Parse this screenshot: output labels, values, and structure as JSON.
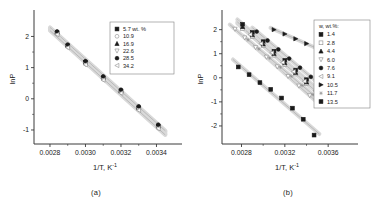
{
  "figure": {
    "panel_a_caption": "(a)",
    "panel_b_caption": "(b)"
  },
  "chart_data": [
    {
      "id": "panel_a",
      "type": "scatter",
      "title": "",
      "caption": "(a)",
      "xlabel": "1/T, K",
      "xlabel_sup": "-1",
      "ylabel": "lnP",
      "xlim": [
        0.00271,
        0.00351
      ],
      "ylim": [
        -1.45,
        2.72
      ],
      "xticks": [
        0.0028,
        0.003,
        0.0032,
        0.0034
      ],
      "xticklabels": [
        "0.0028",
        "0.0030",
        "0.0032",
        "0.0034"
      ],
      "yticks": [
        -1,
        0,
        1,
        2
      ],
      "yticklabels": [
        "-1",
        "0",
        "1",
        "2"
      ],
      "grid": false,
      "legend_position": "upper-right",
      "legend_title": "",
      "series": [
        {
          "name": "5.7 wt. %",
          "marker": "square-filled",
          "color": "#1a1a1a",
          "x": [
            0.00284,
            0.0029,
            0.003,
            0.0031,
            0.0032,
            0.0033,
            0.00341
          ],
          "y": [
            2.12,
            1.7,
            1.17,
            0.67,
            0.25,
            -0.29,
            -0.88
          ]
        },
        {
          "name": "10.9",
          "marker": "circle-open",
          "color": "#8c8c8c",
          "x": [
            0.00284,
            0.0029,
            0.003,
            0.0031,
            0.0032,
            0.0033,
            0.00341
          ],
          "y": [
            2.1,
            1.68,
            1.13,
            0.64,
            0.22,
            -0.33,
            -0.92
          ]
        },
        {
          "name": "16.9",
          "marker": "triangle-up-filled",
          "color": "#1a1a1a",
          "x": [
            0.00284,
            0.0029,
            0.003,
            0.0031,
            0.0032,
            0.0033,
            0.00341
          ],
          "y": [
            2.14,
            1.72,
            1.19,
            0.7,
            0.27,
            -0.26,
            -0.85
          ]
        },
        {
          "name": "22.6",
          "marker": "triangle-down-open",
          "color": "#8c8c8c",
          "x": [
            0.00284,
            0.0029,
            0.003,
            0.0031,
            0.0032,
            0.0033,
            0.00341
          ],
          "y": [
            2.08,
            1.66,
            1.11,
            0.62,
            0.2,
            -0.35,
            -0.94
          ]
        },
        {
          "name": "28.5",
          "marker": "circle-filled",
          "color": "#1a1a1a",
          "x": [
            0.00284,
            0.0029,
            0.003,
            0.0031,
            0.0032,
            0.0033,
            0.00341
          ],
          "y": [
            2.16,
            1.74,
            1.21,
            0.72,
            0.29,
            -0.24,
            -0.83
          ]
        },
        {
          "name": "34.2",
          "marker": "triangle-left-open",
          "color": "#8c8c8c",
          "x": [
            0.00284,
            0.0029,
            0.003,
            0.0031,
            0.0032,
            0.0033,
            0.00341
          ],
          "y": [
            2.06,
            1.64,
            1.09,
            0.6,
            0.18,
            -0.37,
            -0.96
          ]
        }
      ],
      "legend_entries": [
        {
          "label": "5.7 wt. %",
          "marker": "square-filled"
        },
        {
          "label": "10.9",
          "marker": "circle-open"
        },
        {
          "label": "16.9",
          "marker": "triangle-up-filled"
        },
        {
          "label": "22.6",
          "marker": "triangle-down-open"
        },
        {
          "label": "28.5",
          "marker": "circle-filled"
        },
        {
          "label": "34.2",
          "marker": "triangle-left-open"
        }
      ]
    },
    {
      "id": "panel_b",
      "type": "scatter",
      "title": "",
      "caption": "(b)",
      "xlabel": "1/T, K",
      "xlabel_sup": "-1",
      "ylabel": "lnP",
      "xlim": [
        0.00262,
        0.00382
      ],
      "ylim": [
        -2.75,
        2.65
      ],
      "xticks": [
        0.0028,
        0.0032,
        0.0036
      ],
      "xticklabels": [
        "0.0028",
        "0.0032",
        "0.0036"
      ],
      "yticks": [
        -2,
        -1,
        0,
        1,
        2
      ],
      "yticklabels": [
        "-2",
        "-1",
        "0",
        "1",
        "2"
      ],
      "grid": false,
      "legend_position": "upper-right",
      "legend_title": "w, wt.%:",
      "series": [
        {
          "name": "1.4",
          "marker": "square-filled",
          "color": "#1a1a1a",
          "x": [
            0.00281,
            0.0029,
            0.003,
            0.0031,
            0.0032,
            0.0033,
            0.0034,
            0.0035
          ],
          "y": [
            2.22,
            1.88,
            1.5,
            1.1,
            0.72,
            0.32,
            -0.08,
            -0.48
          ]
        },
        {
          "name": "2.8",
          "marker": "square-open",
          "color": "#8c8c8c",
          "x": [
            0.00281,
            0.0029,
            0.003,
            0.0031,
            0.0032,
            0.0033,
            0.0034,
            0.0035
          ],
          "y": [
            2.05,
            1.72,
            1.34,
            0.94,
            0.55,
            0.16,
            -0.24,
            -0.63
          ]
        },
        {
          "name": "4.4",
          "marker": "triangle-up-filled",
          "color": "#1a1a1a",
          "x": [
            0.00281,
            0.0029,
            0.003,
            0.0031,
            0.0032,
            0.0033,
            0.0034,
            0.0035
          ],
          "y": [
            2.12,
            1.78,
            1.4,
            1.0,
            0.62,
            0.22,
            -0.18,
            -0.56
          ]
        },
        {
          "name": "6.0",
          "marker": "triangle-down-open",
          "color": "#8c8c8c",
          "x": [
            0.00274,
            0.00283,
            0.00293,
            0.00303,
            0.00313,
            0.00323,
            0.00333,
            0.00343
          ],
          "y": [
            2.02,
            1.66,
            1.26,
            0.86,
            0.46,
            0.06,
            -0.34,
            -0.74
          ]
        },
        {
          "name": "7.6",
          "marker": "circle-filled",
          "color": "#1a1a1a",
          "x": [
            0.00294,
            0.00304,
            0.00314,
            0.00324,
            0.00334,
            0.00344,
            0.00352
          ],
          "y": [
            1.92,
            1.55,
            1.18,
            0.8,
            0.42,
            0.04,
            -0.28
          ]
        },
        {
          "name": "9.1",
          "marker": "triangle-left-open",
          "color": "#8c8c8c",
          "x": [
            0.00288,
            0.00298,
            0.00308,
            0.00318,
            0.00328,
            0.00338,
            0.00348
          ],
          "y": [
            1.8,
            1.42,
            1.04,
            0.64,
            0.26,
            -0.14,
            -0.54
          ]
        },
        {
          "name": "10.5",
          "marker": "triangle-right-filled",
          "color": "#1a1a1a",
          "x": [
            0.0031,
            0.0032,
            0.0033,
            0.0034,
            0.0035,
            0.00356
          ],
          "y": [
            2.0,
            1.82,
            1.62,
            1.42,
            1.22,
            1.08
          ]
        },
        {
          "name": "11.7",
          "marker": "star-open",
          "color": "#8c8c8c",
          "x": [
            0.00286,
            0.00296,
            0.00306,
            0.00316,
            0.00326,
            0.00336,
            0.00346
          ],
          "y": [
            1.58,
            1.2,
            0.82,
            0.44,
            0.06,
            -0.32,
            -0.7
          ]
        },
        {
          "name": "13.5",
          "marker": "square-filled",
          "color": "#1a1a1a",
          "x": [
            0.00277,
            0.00287,
            0.00297,
            0.00307,
            0.00317,
            0.00327,
            0.00337,
            0.00347
          ],
          "y": [
            0.45,
            0.13,
            -0.2,
            -0.48,
            -0.84,
            -1.26,
            -1.72,
            -2.38
          ]
        }
      ],
      "legend_entries": [
        {
          "label": "1.4",
          "marker": "square-filled"
        },
        {
          "label": "2.8",
          "marker": "square-open"
        },
        {
          "label": "4.4",
          "marker": "triangle-up-filled"
        },
        {
          "label": "6.0",
          "marker": "triangle-down-open"
        },
        {
          "label": "7.6",
          "marker": "circle-filled"
        },
        {
          "label": "9.1",
          "marker": "triangle-left-open"
        },
        {
          "label": "10.5",
          "marker": "triangle-right-filled"
        },
        {
          "label": "11.7",
          "marker": "star-open"
        },
        {
          "label": "13.5",
          "marker": "square-filled"
        }
      ]
    }
  ]
}
